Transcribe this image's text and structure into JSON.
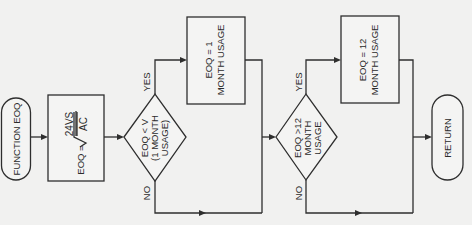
{
  "diagram": {
    "type": "flowchart",
    "orientation": "rotated-90-ccw",
    "colors": {
      "background": "#f1f1f0",
      "stroke": "#2e2e2e",
      "text": "#2b2b2b"
    },
    "start": {
      "label": "FUNCTION EOQ"
    },
    "formula": {
      "lhs": "EOQ =",
      "numerator": "24VS",
      "denominator": "AC",
      "radical": "√"
    },
    "decision1": {
      "line1": "EOQ < V",
      "line2": "(1 MONTH",
      "line3": "USAGE)",
      "yes_label": "YES",
      "no_label": "NO"
    },
    "process1": {
      "line1": "EOQ = 1",
      "line2": "MONTH USAGE"
    },
    "decision2": {
      "line1": "EOQ >12",
      "line2": "MONTH",
      "line3": "USAGE",
      "yes_label": "YES",
      "no_label": "NO"
    },
    "process2": {
      "line1": "EOQ = 12",
      "line2": "MONTH USAGE"
    },
    "end": {
      "label": "RETURN"
    }
  }
}
